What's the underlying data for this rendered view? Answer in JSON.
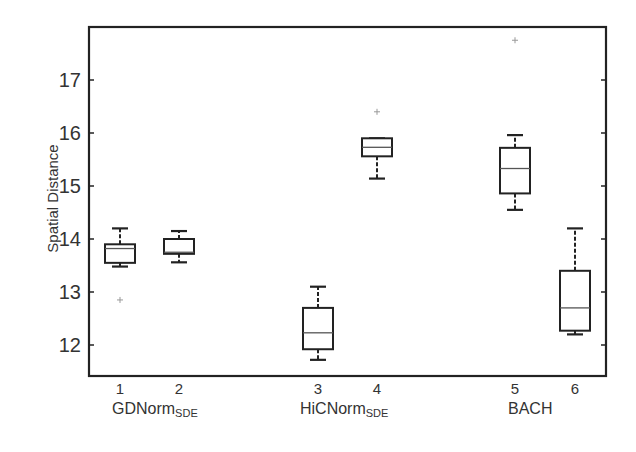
{
  "chart_data": {
    "type": "box",
    "title": "",
    "xlabel": "",
    "ylabel": "Spatial Distance",
    "ylim": [
      11.4,
      17.95
    ],
    "yticks": [
      12,
      13,
      14,
      15,
      16,
      17
    ],
    "xticks": [
      "1",
      "2",
      "3",
      "4",
      "5",
      "6"
    ],
    "groups": [
      {
        "name": "GDNorm",
        "subscript": "SDE",
        "boxes": [
          1,
          2
        ]
      },
      {
        "name": "HiCNorm",
        "subscript": "SDE",
        "boxes": [
          3,
          4
        ]
      },
      {
        "name": "BACH",
        "subscript": "",
        "boxes": [
          5,
          6
        ]
      }
    ],
    "series": [
      {
        "name": "1",
        "whisker_low": 13.48,
        "q1": 13.55,
        "median": 13.82,
        "q3": 13.9,
        "whisker_high": 14.2,
        "outliers": [
          12.85
        ]
      },
      {
        "name": "2",
        "whisker_low": 13.56,
        "q1": 13.72,
        "median": 13.75,
        "q3": 14.0,
        "whisker_high": 14.15,
        "outliers": []
      },
      {
        "name": "3",
        "whisker_low": 11.72,
        "q1": 11.92,
        "median": 12.23,
        "q3": 12.7,
        "whisker_high": 13.1,
        "outliers": []
      },
      {
        "name": "4",
        "whisker_low": 15.14,
        "q1": 15.56,
        "median": 15.73,
        "q3": 15.9,
        "whisker_high": 15.9,
        "outliers": [
          16.4
        ]
      },
      {
        "name": "5",
        "whisker_low": 14.55,
        "q1": 14.86,
        "median": 15.33,
        "q3": 15.72,
        "whisker_high": 15.96,
        "outliers": [
          17.75
        ]
      },
      {
        "name": "6",
        "whisker_low": 12.2,
        "q1": 12.27,
        "median": 12.7,
        "q3": 13.4,
        "whisker_high": 14.2,
        "outliers": []
      }
    ],
    "grid": false,
    "legend": null
  },
  "axis": {
    "ylabel": "Spatial Distance"
  },
  "groups": {
    "g1": {
      "name": "GDNorm",
      "sub": "SDE"
    },
    "g2": {
      "name": "HiCNorm",
      "sub": "SDE"
    },
    "g3": {
      "name": "BACH"
    }
  }
}
